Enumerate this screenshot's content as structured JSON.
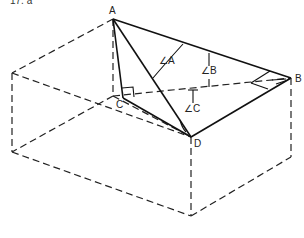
{
  "caption": "17. a",
  "points": {
    "A": {
      "label": "A",
      "x": 113,
      "y": 19
    },
    "B": {
      "label": "B",
      "x": 291,
      "y": 78
    },
    "C": {
      "label": "C",
      "x": 123,
      "y": 98
    },
    "D": {
      "label": "D",
      "x": 191,
      "y": 137
    }
  },
  "angles": {
    "A": "∠A",
    "B": "∠B",
    "C": "∠C"
  },
  "colors": {
    "stroke": "#222222",
    "background": "#ffffff"
  }
}
